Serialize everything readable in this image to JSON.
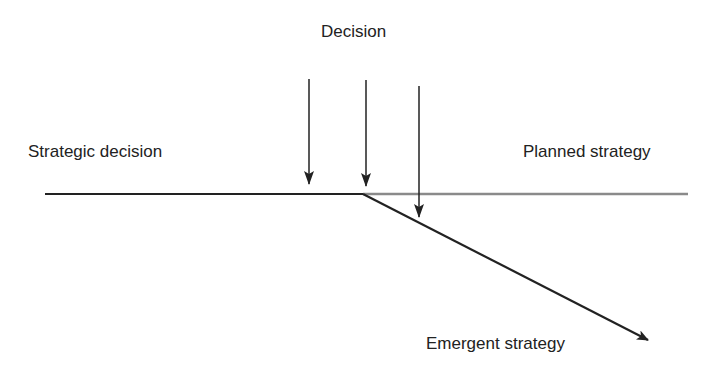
{
  "diagram": {
    "labels": {
      "decision": "Decision",
      "strategic_decision": "Strategic decision",
      "planned_strategy": "Planned strategy",
      "emergent_strategy": "Emergent strategy"
    },
    "colors": {
      "line": "#222222",
      "planned_line": "#888888",
      "text": "#222222",
      "background": "#ffffff"
    },
    "elements": [
      {
        "id": "strategic-decision-line",
        "type": "line",
        "from": [
          45,
          194
        ],
        "to": [
          363,
          194
        ]
      },
      {
        "id": "planned-strategy-line",
        "type": "line",
        "style": "grey",
        "from": [
          363,
          194
        ],
        "to": [
          688,
          194
        ]
      },
      {
        "id": "emergent-strategy-arrow",
        "type": "arrow",
        "from": [
          363,
          194
        ],
        "to": [
          648,
          340
        ]
      },
      {
        "id": "decision-arrow-1",
        "type": "arrow",
        "from": [
          309,
          79
        ],
        "to": [
          309,
          183
        ]
      },
      {
        "id": "decision-arrow-2",
        "type": "arrow",
        "from": [
          366,
          80
        ],
        "to": [
          366,
          185
        ]
      },
      {
        "id": "decision-arrow-3",
        "type": "arrow",
        "from": [
          419,
          86
        ],
        "to": [
          419,
          216
        ]
      }
    ]
  }
}
